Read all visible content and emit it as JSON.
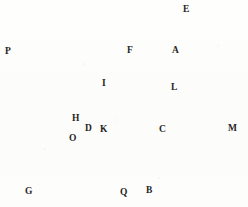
{
  "figure": {
    "width": 248,
    "height": 207,
    "background_color": "#fdfdfc",
    "ink_color": "#2a2724",
    "dotted_color": "#6b6660"
  },
  "points": [
    {
      "id": "E",
      "label": "E",
      "x": 178,
      "y": 13,
      "label_x": 183,
      "label_y": 5
    },
    {
      "id": "P",
      "label": "P",
      "x": 6,
      "y": 64,
      "label_x": 5,
      "label_y": 47
    },
    {
      "id": "F",
      "label": "F",
      "x": 132,
      "y": 62,
      "label_x": 127,
      "label_y": 46
    },
    {
      "id": "A",
      "label": "A",
      "x": 175,
      "y": 58,
      "label_x": 172,
      "label_y": 46
    },
    {
      "id": "I",
      "label": "I",
      "x": 107,
      "y": 89,
      "label_x": 102,
      "label_y": 79
    },
    {
      "id": "L",
      "label": "L",
      "x": 166,
      "y": 89,
      "label_x": 171,
      "label_y": 83
    },
    {
      "id": "H",
      "label": "H",
      "x": 79,
      "y": 124,
      "label_x": 72,
      "label_y": 114
    },
    {
      "id": "D",
      "label": "D",
      "x": 92,
      "y": 126,
      "label_x": 85,
      "label_y": 124
    },
    {
      "id": "K",
      "label": "K",
      "x": 104,
      "y": 126,
      "label_x": 100,
      "label_y": 125
    },
    {
      "id": "C",
      "label": "C",
      "x": 160,
      "y": 126,
      "label_x": 159,
      "label_y": 125
    },
    {
      "id": "M",
      "label": "M",
      "x": 228,
      "y": 126,
      "label_x": 228,
      "label_y": 124
    },
    {
      "id": "O",
      "label": "O",
      "x": 73,
      "y": 131,
      "label_x": 69,
      "label_y": 134
    },
    {
      "id": "G",
      "label": "G",
      "x": 22,
      "y": 185,
      "label_x": 25,
      "label_y": 187
    },
    {
      "id": "Q",
      "label": "Q",
      "x": 124,
      "y": 185,
      "label_x": 120,
      "label_y": 188
    },
    {
      "id": "B",
      "label": "B",
      "x": 148,
      "y": 192,
      "label_x": 146,
      "label_y": 186
    }
  ],
  "circle": {
    "name": "main-circle",
    "center_x": 160,
    "center_y": 126,
    "radius_x": 68,
    "radius_y": 66
  },
  "segments": [
    {
      "name": "line-P-A-right",
      "x1": 6,
      "y1": 64,
      "x2": 205,
      "y2": 59
    },
    {
      "name": "line-G-Q-B-right",
      "x1": 22,
      "y1": 185,
      "x2": 192,
      "y2": 182
    },
    {
      "name": "line-D-C-M",
      "x1": 63,
      "y1": 127,
      "x2": 234,
      "y2": 124
    },
    {
      "name": "line-E-to-G",
      "x1": 178,
      "y1": 15,
      "x2": 22,
      "y2": 185
    },
    {
      "name": "line-E-to-B",
      "x1": 178,
      "y1": 15,
      "x2": 148,
      "y2": 193
    },
    {
      "name": "line-P-to-B",
      "x1": 6,
      "y1": 65,
      "x2": 150,
      "y2": 193
    }
  ],
  "dotted_segments": [
    {
      "name": "dotted-I-to-L",
      "x1": 108,
      "y1": 89,
      "x2": 168,
      "y2": 89
    },
    {
      "name": "dotted-I-to-K",
      "x1": 107,
      "y1": 90,
      "x2": 104,
      "y2": 127
    }
  ],
  "chart_data": {
    "type": "diagram",
    "vertices": [
      "E",
      "P",
      "F",
      "A",
      "I",
      "L",
      "H",
      "D",
      "K",
      "C",
      "M",
      "O",
      "G",
      "Q",
      "B"
    ],
    "edges": [
      [
        "P",
        "A"
      ],
      [
        "G",
        "B"
      ],
      [
        "D",
        "M"
      ],
      [
        "E",
        "G"
      ],
      [
        "E",
        "B"
      ],
      [
        "P",
        "B"
      ]
    ],
    "dotted_edges": [
      [
        "I",
        "L"
      ],
      [
        "I",
        "K"
      ]
    ],
    "circle": {
      "center": "C",
      "tangent_points": [
        "A",
        "B"
      ],
      "diameter_endpoints": [
        "D",
        "M"
      ]
    }
  }
}
